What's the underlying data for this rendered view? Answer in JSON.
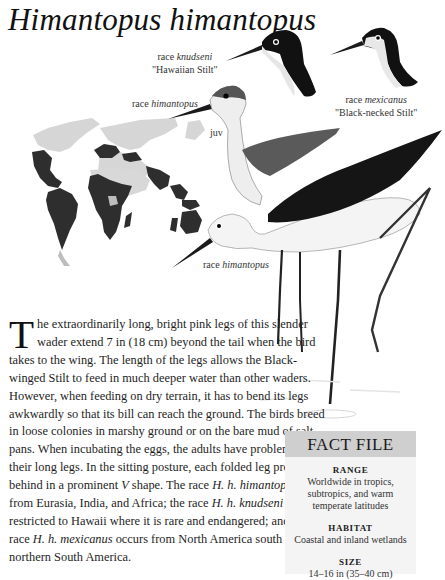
{
  "page": {
    "title": "Himantopus himantopus"
  },
  "illustration": {
    "captions": {
      "knudseni": {
        "prefix": "race ",
        "race": "knudseni",
        "common": "\"Hawaiian Stilt\""
      },
      "mexicanus": {
        "prefix": "race ",
        "race": "mexicanus",
        "common": "\"Black-necked Stilt\""
      },
      "himantopus_juv": {
        "prefix": "race ",
        "race": "himantopus"
      },
      "juv": "juv",
      "himantopus_adult": {
        "prefix": "race ",
        "race": "himantopus"
      }
    },
    "map": {
      "description": "world distribution map",
      "land_color": "#d4d4d4",
      "range_color": "#333333"
    }
  },
  "article": {
    "dropcap": "T",
    "segments": [
      {
        "text": "he extraordinarily long, bright pink legs of this slender wader extend 7 in (18 cm) beyond the tail when the bird takes to the wing. The length of the legs allows the Black-winged Stilt to feed in much deeper water than other waders. However, when feeding on dry terrain, it has to bend its legs awkwardly so that its bill can reach the ground. The birds breed in loose colonies in marshy ground or on the bare mud of salt pans. When incubating the eggs, the adults have problems with their long legs. In the sitting posture, each folded leg projects behind in a prominent ",
        "italic": false
      },
      {
        "text": "V",
        "italic": true
      },
      {
        "text": " shape. The race ",
        "italic": false
      },
      {
        "text": "H. h. himantopus",
        "italic": true
      },
      {
        "text": " is from Eurasia, India, and Africa; the race ",
        "italic": false
      },
      {
        "text": "H. h. knudseni",
        "italic": true
      },
      {
        "text": " is restricted to Hawaii where it is rare and endangered; and the race ",
        "italic": false
      },
      {
        "text": "H. h. mexicanus",
        "italic": true
      },
      {
        "text": " occurs from North America south to northern South America.",
        "italic": false
      }
    ]
  },
  "fact_file": {
    "header": "FACT FILE",
    "sections": [
      {
        "label": "RANGE",
        "value": "Worldwide in tropics, subtropics, and warm temperate latitudes"
      },
      {
        "label": "HABITAT",
        "value": "Coastal and inland wetlands"
      },
      {
        "label": "SIZE",
        "value": "14–16 in (35–40 cm)"
      }
    ],
    "header_bg": "#cfcfcf",
    "body_bg": "#f4f4f4"
  }
}
